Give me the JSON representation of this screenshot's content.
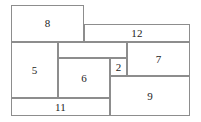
{
  "figure": {
    "width": 201,
    "height": 122,
    "background_color": "#ffffff",
    "line_color": "#8d8d8d",
    "label_color": "#1c1c1c",
    "line_width_px": 1
  },
  "chart_data": {
    "type": "diagram",
    "subtype": "rectangle-dissection",
    "bounding_box": {
      "x": 11,
      "y": 5,
      "width": 179,
      "height": 111
    },
    "tiles": [
      {
        "label": "8",
        "x": 11,
        "y": 5,
        "width": 73,
        "height": 37
      },
      {
        "label": "12",
        "x": 84,
        "y": 24,
        "width": 106,
        "height": 18
      },
      {
        "label": "5",
        "x": 11,
        "y": 42,
        "width": 47,
        "height": 56
      },
      {
        "label": "",
        "x": 58,
        "y": 42,
        "width": 69,
        "height": 16
      },
      {
        "label": "7",
        "x": 127,
        "y": 42,
        "width": 63,
        "height": 34
      },
      {
        "label": "6",
        "x": 58,
        "y": 58,
        "width": 52,
        "height": 40
      },
      {
        "label": "2",
        "x": 110,
        "y": 58,
        "width": 17,
        "height": 18
      },
      {
        "label": "9",
        "x": 110,
        "y": 76,
        "width": 80,
        "height": 40
      },
      {
        "label": "11",
        "x": 11,
        "y": 98,
        "width": 99,
        "height": 18
      }
    ]
  }
}
